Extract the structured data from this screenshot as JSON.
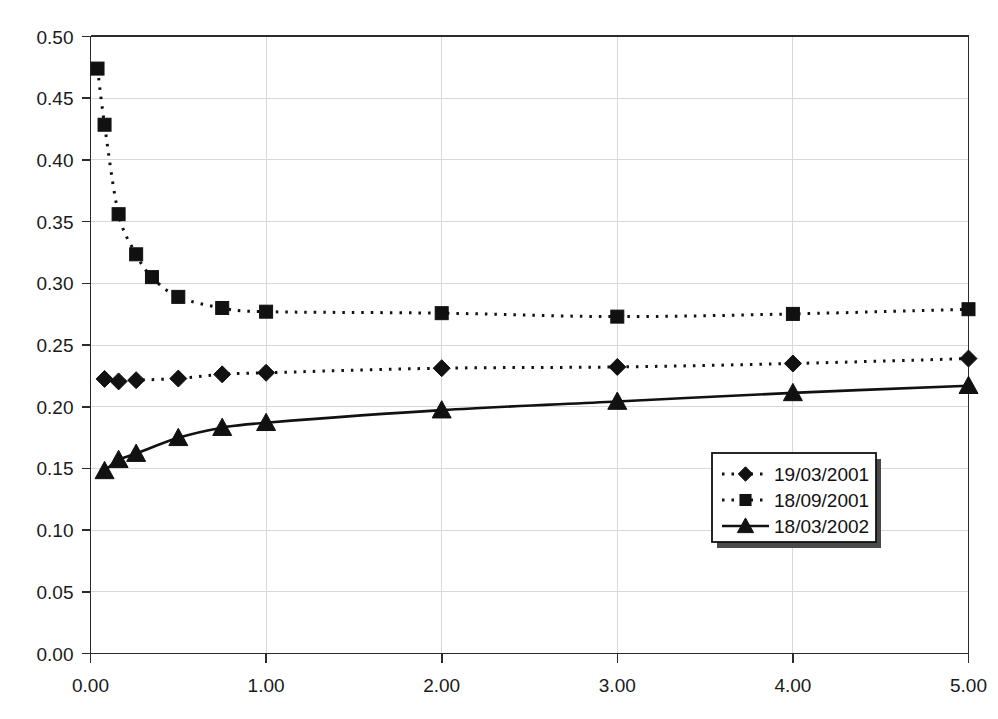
{
  "chart_data": {
    "type": "line",
    "title": "",
    "subtitle": "",
    "xlabel": "",
    "ylabel": "",
    "xlim": [
      0.0,
      5.0
    ],
    "ylim": [
      0.0,
      0.5
    ],
    "grid": true,
    "legend_position": "inside-bottom-right",
    "x_tick_labels": [
      "0.00",
      "1.00",
      "2.00",
      "3.00",
      "4.00",
      "5.00"
    ],
    "x_ticks": [
      0.0,
      1.0,
      2.0,
      3.0,
      4.0,
      5.0
    ],
    "y_tick_labels": [
      "0.00",
      "0.05",
      "0.10",
      "0.15",
      "0.20",
      "0.25",
      "0.30",
      "0.35",
      "0.40",
      "0.45",
      "0.50"
    ],
    "y_ticks": [
      0.0,
      0.05,
      0.1,
      0.15,
      0.2,
      0.25,
      0.3,
      0.35,
      0.4,
      0.45,
      0.5
    ],
    "series": [
      {
        "name": "19/03/2001",
        "marker": "diamond",
        "line_style": "dashed",
        "color": "#111111",
        "points": [
          [
            0.08,
            0.2225
          ],
          [
            0.16,
            0.2205
          ],
          [
            0.26,
            0.2215
          ],
          [
            0.5,
            0.2228
          ],
          [
            0.75,
            0.2262
          ],
          [
            1.0,
            0.2275
          ],
          [
            2.0,
            0.2312
          ],
          [
            3.0,
            0.2322
          ],
          [
            4.0,
            0.235
          ],
          [
            5.0,
            0.239
          ]
        ]
      },
      {
        "name": "18/09/2001",
        "marker": "square",
        "line_style": "dashed",
        "color": "#111111",
        "points": [
          [
            0.04,
            0.474
          ],
          [
            0.08,
            0.4285
          ],
          [
            0.16,
            0.356
          ],
          [
            0.26,
            0.3235
          ],
          [
            0.35,
            0.305
          ],
          [
            0.5,
            0.289
          ],
          [
            0.75,
            0.28
          ],
          [
            1.0,
            0.277
          ],
          [
            2.0,
            0.2758
          ],
          [
            3.0,
            0.273
          ],
          [
            4.0,
            0.2752
          ],
          [
            5.0,
            0.279
          ]
        ]
      },
      {
        "name": "18/03/2002",
        "marker": "triangle",
        "line_style": "solid",
        "color": "#111111",
        "points": [
          [
            0.08,
            0.148
          ],
          [
            0.16,
            0.157
          ],
          [
            0.26,
            0.162
          ],
          [
            0.5,
            0.1748
          ],
          [
            0.75,
            0.183
          ],
          [
            1.0,
            0.187
          ],
          [
            2.0,
            0.1972
          ],
          [
            3.0,
            0.2042
          ],
          [
            4.0,
            0.2112
          ],
          [
            5.0,
            0.217
          ]
        ]
      }
    ]
  },
  "legend": {
    "entries": [
      {
        "label": "19/03/2001",
        "marker": "diamond",
        "line_style": "dashed"
      },
      {
        "label": "18/09/2001",
        "marker": "square",
        "line_style": "dashed"
      },
      {
        "label": "18/03/2002",
        "marker": "triangle",
        "line_style": "solid"
      }
    ]
  },
  "colors": {
    "background": "#ffffff",
    "gridline": "#d8d8d8",
    "axis": "#2b2b2b",
    "series": "#111111"
  }
}
